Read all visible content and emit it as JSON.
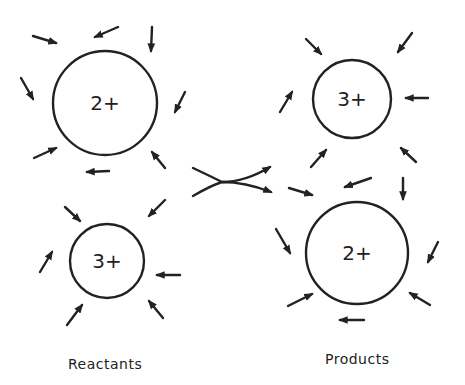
{
  "diagram": {
    "colors": {
      "ink": "#222222",
      "background": "#ffffff"
    },
    "reactants": {
      "label": "Reactants",
      "ions": [
        {
          "charge": "2+",
          "cx": 105,
          "cy": 103,
          "r": 52,
          "arrows": [
            [
              33,
              36,
              56,
              43
            ],
            [
              118,
              27,
              95,
              37
            ],
            [
              152,
              27,
              151,
              51
            ],
            [
              21,
              78,
              33,
              99
            ],
            [
              185,
              92,
              175,
              112
            ],
            [
              34,
              158,
              56,
              148
            ],
            [
              109,
              171,
              87,
              172
            ],
            [
              165,
              168,
              152,
              152
            ]
          ]
        },
        {
          "charge": "3+",
          "cx": 107,
          "cy": 261,
          "r": 37,
          "arrows": [
            [
              65,
              207,
              80,
              221
            ],
            [
              165,
              200,
              149,
              216
            ],
            [
              40,
              272,
              52,
              252
            ],
            [
              180,
              275,
              157,
              275
            ],
            [
              67,
              325,
              82,
              305
            ],
            [
              163,
              318,
              149,
              301
            ]
          ]
        }
      ]
    },
    "products": {
      "label": "Products",
      "ions": [
        {
          "charge": "3+",
          "cx": 352,
          "cy": 99,
          "r": 39,
          "arrows": [
            [
              306,
              39,
              321,
              54
            ],
            [
              412,
              33,
              398,
              52
            ],
            [
              280,
              112,
              292,
              92
            ],
            [
              428,
              98,
              406,
              98
            ],
            [
              311,
              167,
              326,
              150
            ],
            [
              416,
              162,
              401,
              148
            ]
          ]
        },
        {
          "charge": "2+",
          "cx": 357,
          "cy": 253,
          "r": 51,
          "arrows": [
            [
              289,
              188,
              312,
              195
            ],
            [
              371,
              178,
              345,
              187
            ],
            [
              403,
              178,
              403,
              199
            ],
            [
              276,
              229,
              290,
              253
            ],
            [
              438,
              242,
              428,
              262
            ],
            [
              288,
              306,
              312,
              294
            ],
            [
              364,
              320,
              340,
              320
            ],
            [
              430,
              305,
              410,
              293
            ]
          ]
        }
      ]
    },
    "exchange_arrow": {
      "meaning": "electron exchange / crossing arrow"
    }
  }
}
